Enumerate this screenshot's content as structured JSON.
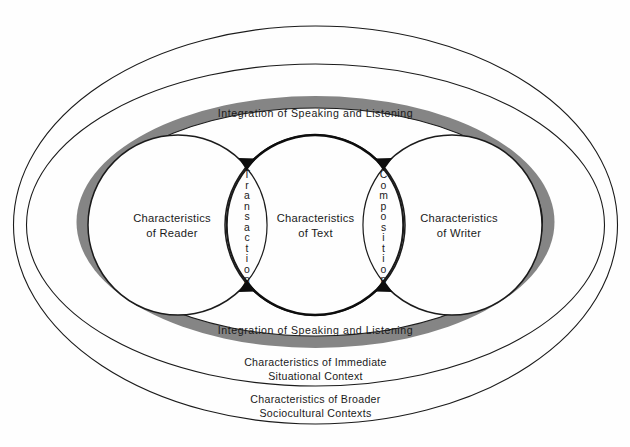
{
  "diagram": {
    "title_vis": "",
    "colors": {
      "band_gray": "#858585",
      "stroke_dark": "#1b1b1b",
      "background": "#fefefe",
      "text": "#1a1a1a"
    },
    "core_circles": [
      {
        "id": "reader",
        "line1": "Characteristics",
        "line2": "of Reader"
      },
      {
        "id": "text",
        "line1": "Characteristics",
        "line2": "of Text"
      },
      {
        "id": "writer",
        "line1": "Characteristics",
        "line2": "of Writer"
      }
    ],
    "lenses": [
      {
        "id": "transaction",
        "label": "Transaction",
        "letters": [
          "T",
          "r",
          "a",
          "n",
          "s",
          "a",
          "c",
          "t",
          "i",
          "o",
          "n"
        ]
      },
      {
        "id": "composition",
        "label": "Composition",
        "letters": [
          "C",
          "o",
          "m",
          "p",
          "o",
          "s",
          "i",
          "t",
          "i",
          "o",
          "n"
        ]
      }
    ],
    "band": {
      "top_label": "Integration of Speaking and Listening",
      "bottom_label": "Integration of Speaking and Listening"
    },
    "rings": [
      {
        "id": "immediate-context",
        "line1": "Characteristics of Immediate",
        "line2": "Situational Context"
      },
      {
        "id": "broader-context",
        "line1": "Characteristics of Broader",
        "line2": "Sociocultural Contexts"
      }
    ]
  }
}
